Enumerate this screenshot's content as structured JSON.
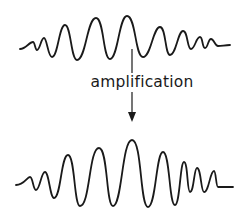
{
  "diagram": {
    "label": "amplification",
    "colors": {
      "stroke": "#1a1a1a",
      "background": "#ffffff"
    },
    "top_wave": {
      "description": "input signal: wave packet with lower amplitude",
      "points": [
        [
          20,
          49
        ],
        [
          33,
          42
        ],
        [
          37,
          50
        ],
        [
          44,
          38
        ],
        [
          52,
          57
        ],
        [
          65,
          25
        ],
        [
          77,
          60
        ],
        [
          96,
          18
        ],
        [
          110,
          59
        ],
        [
          127,
          16
        ],
        [
          143,
          57
        ],
        [
          160,
          27
        ],
        [
          170,
          55
        ],
        [
          183,
          31
        ],
        [
          191,
          49
        ],
        [
          200,
          37
        ],
        [
          205,
          48
        ],
        [
          211,
          39
        ],
        [
          218,
          46
        ],
        [
          230,
          45
        ]
      ]
    },
    "bottom_wave": {
      "description": "output signal: amplified wave packet with higher amplitude",
      "points": [
        [
          16,
          185
        ],
        [
          30,
          177
        ],
        [
          36,
          190
        ],
        [
          45,
          172
        ],
        [
          54,
          198
        ],
        [
          68,
          155
        ],
        [
          80,
          206
        ],
        [
          99,
          148
        ],
        [
          113,
          206
        ],
        [
          132,
          140
        ],
        [
          148,
          207
        ],
        [
          163,
          152
        ],
        [
          175,
          205
        ],
        [
          184,
          162
        ],
        [
          190,
          192
        ],
        [
          197,
          168
        ],
        [
          204,
          192
        ],
        [
          214,
          171
        ],
        [
          218,
          187
        ],
        [
          233,
          187
        ]
      ]
    },
    "arrow": {
      "direction": "down",
      "from": "top_wave",
      "to": "bottom_wave"
    }
  }
}
